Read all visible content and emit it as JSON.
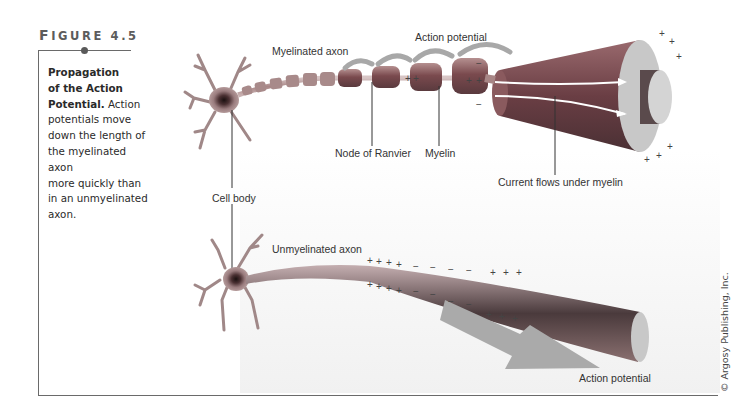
{
  "figure": {
    "label_first": "F",
    "label_rest": "IGURE 4.5",
    "caption_title_line1": "Propagation",
    "caption_title_line2": "of the Action",
    "caption_title_line3": "Potential.",
    "caption_body_line1": " Action",
    "caption_body_line2": "potentials move",
    "caption_body_line3": "down the length of",
    "caption_body_line4": "the myelinated axon",
    "caption_body_line5": "more quickly than",
    "caption_body_line6": "in an unmyelinated",
    "caption_body_line7": "axon."
  },
  "diagram": {
    "labels": {
      "myelinated_axon": "Myelinated axon",
      "action_potential_top": "Action potential",
      "node_of_ranvier": "Node of Ranvier",
      "myelin": "Myelin",
      "current_flows": "Current flows under myelin",
      "cell_body": "Cell body",
      "unmyelinated_axon": "Unmyelinated axon",
      "action_potential_bottom": "Action potential"
    },
    "charges": {
      "plus": "+",
      "minus": "−"
    },
    "colors": {
      "myelin": "#8a5a5a",
      "axon_core": "#b89a9a",
      "arrow": "#9c9c9c",
      "frame": "#6a6a6a"
    }
  },
  "credit": "© Argosy Publishing, Inc."
}
